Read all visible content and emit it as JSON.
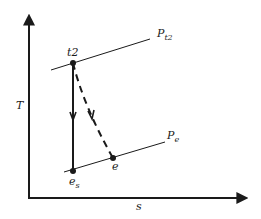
{
  "diagram": {
    "type": "T-s diagram",
    "axes": {
      "y_label": "T",
      "x_label": "s"
    },
    "isobars": [
      {
        "label_main": "P",
        "label_sub": "t2",
        "name": "stagnation pressure line"
      },
      {
        "label_main": "P",
        "label_sub": "e",
        "name": "exit pressure line"
      }
    ],
    "points": [
      {
        "id": "t2",
        "label_main": "t2",
        "label_sub": ""
      },
      {
        "id": "es",
        "label_main": "e",
        "label_sub": "s"
      },
      {
        "id": "e",
        "label_main": "e",
        "label_sub": ""
      }
    ],
    "processes": [
      {
        "from": "t2",
        "to": "es",
        "style": "solid",
        "kind": "isentropic expansion"
      },
      {
        "from": "t2",
        "to": "e",
        "style": "dashed",
        "kind": "actual expansion"
      }
    ],
    "colors": {
      "line": "#1a1a1a",
      "background": "#ffffff"
    }
  }
}
